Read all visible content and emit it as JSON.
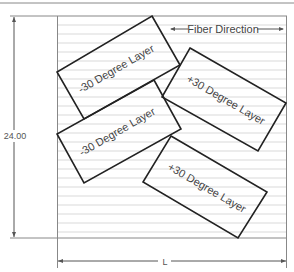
{
  "diagram": {
    "fiber_direction_label": "Fiber Direction",
    "height_dimension": "24.00",
    "length_dimension": "L",
    "layers": [
      {
        "label": "-30 Degree Layer",
        "angle": -30
      },
      {
        "label": "-30 Degree Layer",
        "angle": -30
      },
      {
        "label": "+30 Degree Layer",
        "angle": 30
      },
      {
        "label": "+30 Degree Layer",
        "angle": 30
      }
    ],
    "colors": {
      "outline": "#222222",
      "hatch": "#c8c8c8",
      "frame": "#888888"
    }
  }
}
